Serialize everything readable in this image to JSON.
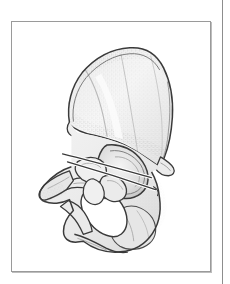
{
  "page": {
    "background_color": "#ffffff",
    "gutter_rule_color": "#8d8d8d"
  },
  "figure": {
    "frame_border_color": "#9a9a9a",
    "frame_background": "#ffffff",
    "caption": "",
    "illustration_name": "hip-bone-os-coxae-lateral-view",
    "description": "Anatomical line drawing of the right hip bone (os coxae) seen from the lateral side, with stippled shading.",
    "line_color": "#3a3a3a",
    "fill_color": "#f2f2f2",
    "shade_color": "#dcdcdc",
    "stipple_color": "#9b9b9b",
    "parts": [
      {
        "name": "iliac-crest",
        "label": "Iliac crest"
      },
      {
        "name": "ilium-wing",
        "label": "Wing of ilium"
      },
      {
        "name": "anterior-superior-iliac-spine",
        "label": "Anterior superior iliac spine"
      },
      {
        "name": "anterior-inferior-iliac-spine",
        "label": "Anterior inferior iliac spine"
      },
      {
        "name": "posterior-superior-iliac-spine",
        "label": "Posterior superior iliac spine"
      },
      {
        "name": "greater-sciatic-notch",
        "label": "Greater sciatic notch"
      },
      {
        "name": "ischial-spine",
        "label": "Ischial spine"
      },
      {
        "name": "acetabulum",
        "label": "Acetabulum"
      },
      {
        "name": "obturator-foramen",
        "label": "Obturator foramen"
      },
      {
        "name": "superior-pubic-ramus",
        "label": "Superior pubic ramus"
      },
      {
        "name": "inferior-pubic-ramus",
        "label": "Inferior pubic ramus"
      },
      {
        "name": "ischial-tuberosity",
        "label": "Ischial tuberosity"
      },
      {
        "name": "pubic-body",
        "label": "Body of pubis"
      }
    ]
  }
}
